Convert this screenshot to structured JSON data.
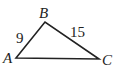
{
  "diagram": {
    "type": "triangle",
    "vertices": [
      {
        "label": "A",
        "x": 16,
        "y": 58
      },
      {
        "label": "B",
        "x": 45,
        "y": 22
      },
      {
        "label": "C",
        "x": 99,
        "y": 59
      }
    ],
    "edges": [
      {
        "from": "A",
        "to": "B",
        "label": "9"
      },
      {
        "from": "B",
        "to": "C",
        "label": "15"
      },
      {
        "from": "A",
        "to": "C",
        "label": ""
      }
    ],
    "stroke_color": "#222222"
  }
}
